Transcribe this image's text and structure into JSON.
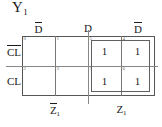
{
  "title": {
    "text": "Y",
    "subscript": "1"
  },
  "map": {
    "type": "karnaugh-map",
    "column_headers": [
      "D̄",
      "D",
      "D̄"
    ],
    "row_labels": [
      "C̄L̄",
      "CL"
    ],
    "bottom_labels": {
      "left": {
        "text": "Z̄",
        "subscript": "1"
      },
      "right": {
        "text": "Z",
        "subscript": "1"
      }
    },
    "cells": [
      {
        "index": "0",
        "value": "",
        "row": 0,
        "col": 0
      },
      {
        "index": "1",
        "value": "",
        "row": 0,
        "col": 1
      },
      {
        "index": "5",
        "value": "1",
        "row": 0,
        "col": 2
      },
      {
        "index": "4",
        "value": "1",
        "row": 0,
        "col": 3
      },
      {
        "index": "2",
        "value": "",
        "row": 1,
        "col": 0
      },
      {
        "index": "3",
        "value": "",
        "row": 1,
        "col": 1
      },
      {
        "index": "7",
        "value": "1",
        "row": 1,
        "col": 2
      },
      {
        "index": "6",
        "value": "1",
        "row": 1,
        "col": 3
      }
    ],
    "groups": [
      {
        "label": "group-of-four",
        "cells": [
          "5",
          "4",
          "7",
          "6"
        ]
      }
    ]
  },
  "colors": {
    "line": "#777777",
    "outline": "#555555",
    "group": "#606060",
    "index_text": "#666666",
    "text": "#1a1a1a",
    "background": "#ffffff"
  }
}
